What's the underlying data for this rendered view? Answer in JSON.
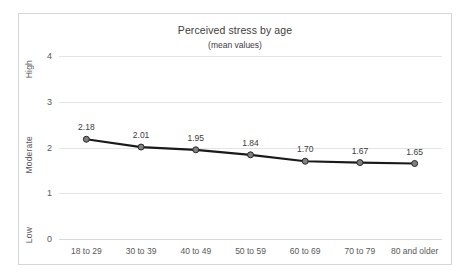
{
  "chart_data": {
    "type": "line",
    "title": "Perceived stress by age",
    "subtitle": "(mean values)",
    "xlabel": "",
    "ylabel": "",
    "categories": [
      "18 to 29",
      "30 to 39",
      "40 to 49",
      "50 to 59",
      "60 to 69",
      "70 to 79",
      "80 and older"
    ],
    "values": [
      2.18,
      2.01,
      1.95,
      1.84,
      1.7,
      1.67,
      1.65
    ],
    "point_labels": [
      "2.18",
      "2.01",
      "1.95",
      "1.84",
      "1.70",
      "1.67",
      "1.65"
    ],
    "ylim": [
      0,
      4
    ],
    "yticks": [
      4,
      3,
      2,
      1,
      0
    ],
    "ytick_labels": [
      "4",
      "3",
      "2",
      "1",
      "0"
    ],
    "y_band_labels": [
      {
        "text": "High",
        "value": 4
      },
      {
        "text": "Moderate",
        "value": 2
      },
      {
        "text": "Low",
        "value": 0
      }
    ],
    "grid": true,
    "legend": false,
    "series_color": "#1a1a1a",
    "marker_fill": "#808080",
    "marker_edge": "#262626",
    "grid_color": "#e4e4e4",
    "text_color": "#404040",
    "plot_background": "#ffffff",
    "border_color": "#d6d6d6"
  }
}
